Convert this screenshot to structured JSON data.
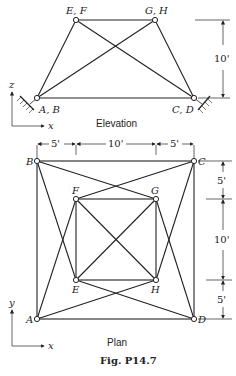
{
  "elevation": {
    "caption": "Elevation",
    "labels": {
      "ab": "A, B",
      "cd": "C, D",
      "ef": "E, F",
      "gh": "G, H"
    },
    "height_dim": "10'",
    "axis": {
      "vertical": "z",
      "horizontal": "x"
    }
  },
  "plan": {
    "caption": "Plan",
    "labels": {
      "a": "A",
      "b": "B",
      "c": "C",
      "d": "D",
      "e": "E",
      "f": "F",
      "g": "G",
      "h": "H"
    },
    "top_dims": [
      "5'",
      "10'",
      "5'"
    ],
    "side_dims": [
      "5'",
      "10'",
      "5'"
    ],
    "axis": {
      "vertical": "y",
      "horizontal": "x"
    }
  },
  "figure_label": "Fig. P14.7"
}
